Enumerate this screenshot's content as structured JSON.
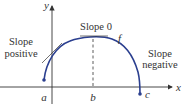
{
  "diagram": {
    "axes": {
      "x_label": "x",
      "y_label": "y"
    },
    "points": [
      {
        "name": "a",
        "label": "a"
      },
      {
        "name": "b",
        "label": "b"
      },
      {
        "name": "c",
        "label": "c"
      }
    ],
    "function_label": "f",
    "annotations": {
      "slope_positive_line1": "Slope",
      "slope_positive_line2": "positive",
      "slope_zero": "Slope 0",
      "slope_negative_line1": "Slope",
      "slope_negative_line2": "negative"
    },
    "colors": {
      "curve": "#2b3f8f",
      "axis": "#333333",
      "text": "#333333"
    }
  }
}
